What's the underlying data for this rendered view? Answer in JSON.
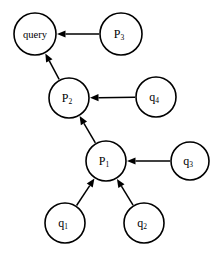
{
  "diagram": {
    "type": "directed-graph",
    "background_color": "#ffffff",
    "stroke_color": "#000000",
    "nodes": [
      {
        "id": "query",
        "label": "query",
        "base": "query",
        "sub": "",
        "cx": 35,
        "cy": 34,
        "r": 21
      },
      {
        "id": "p3",
        "label": "P3",
        "base": "P",
        "sub": "3",
        "cx": 121,
        "cy": 34,
        "r": 21
      },
      {
        "id": "p2",
        "label": "P2",
        "base": "P",
        "sub": "2",
        "cx": 69,
        "cy": 98,
        "r": 20
      },
      {
        "id": "q4",
        "label": "q4",
        "base": "q",
        "sub": "4",
        "cx": 156,
        "cy": 97,
        "r": 20
      },
      {
        "id": "p1",
        "label": "P1",
        "base": "P",
        "sub": "1",
        "cx": 106,
        "cy": 161,
        "r": 20
      },
      {
        "id": "q3",
        "label": "q3",
        "base": "q",
        "sub": "3",
        "cx": 190,
        "cy": 161,
        "r": 19
      },
      {
        "id": "q1",
        "label": "q1",
        "base": "q",
        "sub": "1",
        "cx": 65,
        "cy": 223,
        "r": 20
      },
      {
        "id": "q2",
        "label": "q2",
        "base": "q",
        "sub": "2",
        "cx": 144,
        "cy": 223,
        "r": 20
      }
    ],
    "edges": [
      {
        "id": "p3-to-query",
        "from": "p3",
        "to": "query",
        "directed": true
      },
      {
        "id": "p2-to-query",
        "from": "p2",
        "to": "query",
        "directed": true
      },
      {
        "id": "q4-to-p2",
        "from": "q4",
        "to": "p2",
        "directed": true
      },
      {
        "id": "p1-to-p2",
        "from": "p1",
        "to": "p2",
        "directed": true
      },
      {
        "id": "q3-to-p1",
        "from": "q3",
        "to": "p1",
        "directed": true
      },
      {
        "id": "q1-to-p1",
        "from": "q1",
        "to": "p1",
        "directed": true
      },
      {
        "id": "q2-to-p1",
        "from": "q2",
        "to": "p1",
        "directed": true
      }
    ]
  }
}
